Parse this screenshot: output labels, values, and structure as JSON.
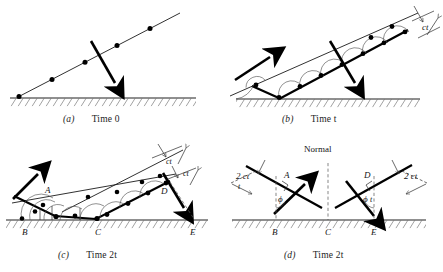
{
  "figure": {
    "title_semantics": "Huygens construction for reflection of a plane wave from a plane surface",
    "panels": [
      {
        "id": "a",
        "caption_letter": "(a)",
        "caption_text": "Time 0",
        "labels": [],
        "wavefront_dot_count": 5,
        "description": "Incident plane wavefront with ray arrow, before reaching surface"
      },
      {
        "id": "b",
        "caption_letter": "(b)",
        "caption_text": "Time t",
        "labels": [
          "ct"
        ],
        "wavefront_dot_count": 10,
        "description": "Wavefront partly reflected, Huygens wavelets of radius ct"
      },
      {
        "id": "c",
        "caption_letter": "(c)",
        "caption_text": "Time 2t",
        "labels": [
          "ct",
          "ct",
          "A",
          "B",
          "C",
          "D",
          "E"
        ],
        "wavefront_dot_count": 14,
        "description": "Wavefront fully reflected, wavelets of radius ct and 2ct"
      },
      {
        "id": "d",
        "caption_letter": "(d)",
        "caption_text": "Time 2t",
        "labels": [
          "Normal",
          "A",
          "B",
          "C",
          "D",
          "E",
          "2ct",
          "2ct",
          "t",
          "t",
          "ϕ",
          "ϕ"
        ],
        "wavefront_dot_count": 0,
        "description": "Geometry of incident and reflected rays with normal and equal angles phi"
      }
    ],
    "symbols": {
      "ct": "ct",
      "two_ct": "2 ct",
      "t_small": "t",
      "phi": "ϕ",
      "normal": "Normal",
      "point_a": "A",
      "point_b": "B",
      "point_c": "C",
      "point_d": "D",
      "point_e": "E"
    },
    "colors": {
      "ink": "#141414",
      "ray": "#000000",
      "wavelet_arc": "#555555",
      "dashed": "#555555",
      "background": "#ffffff"
    },
    "captions": {
      "a_letter": "(a)",
      "a_time": "Time 0",
      "b_letter": "(b)",
      "b_time": "Time t",
      "c_letter": "(c)",
      "c_time": "Time 2t",
      "d_letter": "(d)",
      "d_time": "Time 2t"
    }
  }
}
